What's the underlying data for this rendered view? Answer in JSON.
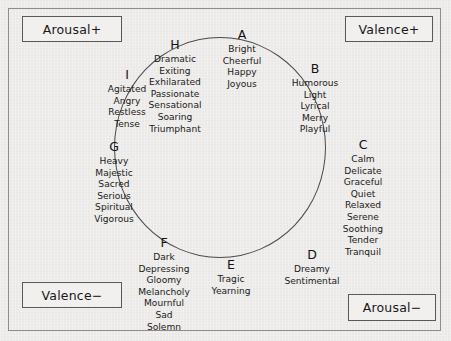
{
  "figure": {
    "shape": "circle",
    "colors": {
      "background": "#eeedeb",
      "frame": "#8d8c8a",
      "circle_stroke": "#4a4a4c",
      "box_stroke": "#59585a",
      "text": "#16151a"
    }
  },
  "axes": {
    "arousal_positive": "Arousal+",
    "valence_positive": "Valence+",
    "valence_negative": "Valence−",
    "arousal_negative": "Arousal−"
  },
  "clusters": [
    {
      "letter": "A",
      "terms": [
        "Bright",
        "Cheerful",
        "Happy",
        "Joyous"
      ]
    },
    {
      "letter": "B",
      "terms": [
        "Humorous",
        "Light",
        "Lyrical",
        "Merry",
        "Playful"
      ]
    },
    {
      "letter": "C",
      "terms": [
        "Calm",
        "Delicate",
        "Graceful",
        "Quiet",
        "Relaxed",
        "Serene",
        "Soothing",
        "Tender",
        "Tranquil"
      ]
    },
    {
      "letter": "D",
      "terms": [
        "Dreamy",
        "Sentimental"
      ]
    },
    {
      "letter": "E",
      "terms": [
        "Tragic",
        "Yearning"
      ]
    },
    {
      "letter": "F",
      "terms": [
        "Dark",
        "Depressing",
        "Gloomy",
        "Melancholy",
        "Mournful",
        "Sad",
        "Solemn"
      ]
    },
    {
      "letter": "G",
      "terms": [
        "Heavy",
        "Majestic",
        "Sacred",
        "Serious",
        "Spiritual",
        "Vigorous"
      ]
    },
    {
      "letter": "H",
      "terms": [
        "Dramatic",
        "Exiting",
        "Exhilarated",
        "Passionate",
        "Sensational",
        "Soaring",
        "Triumphant"
      ]
    },
    {
      "letter": "I",
      "terms": [
        "Agitated",
        "Angry",
        "Restless",
        "Tense"
      ]
    }
  ]
}
